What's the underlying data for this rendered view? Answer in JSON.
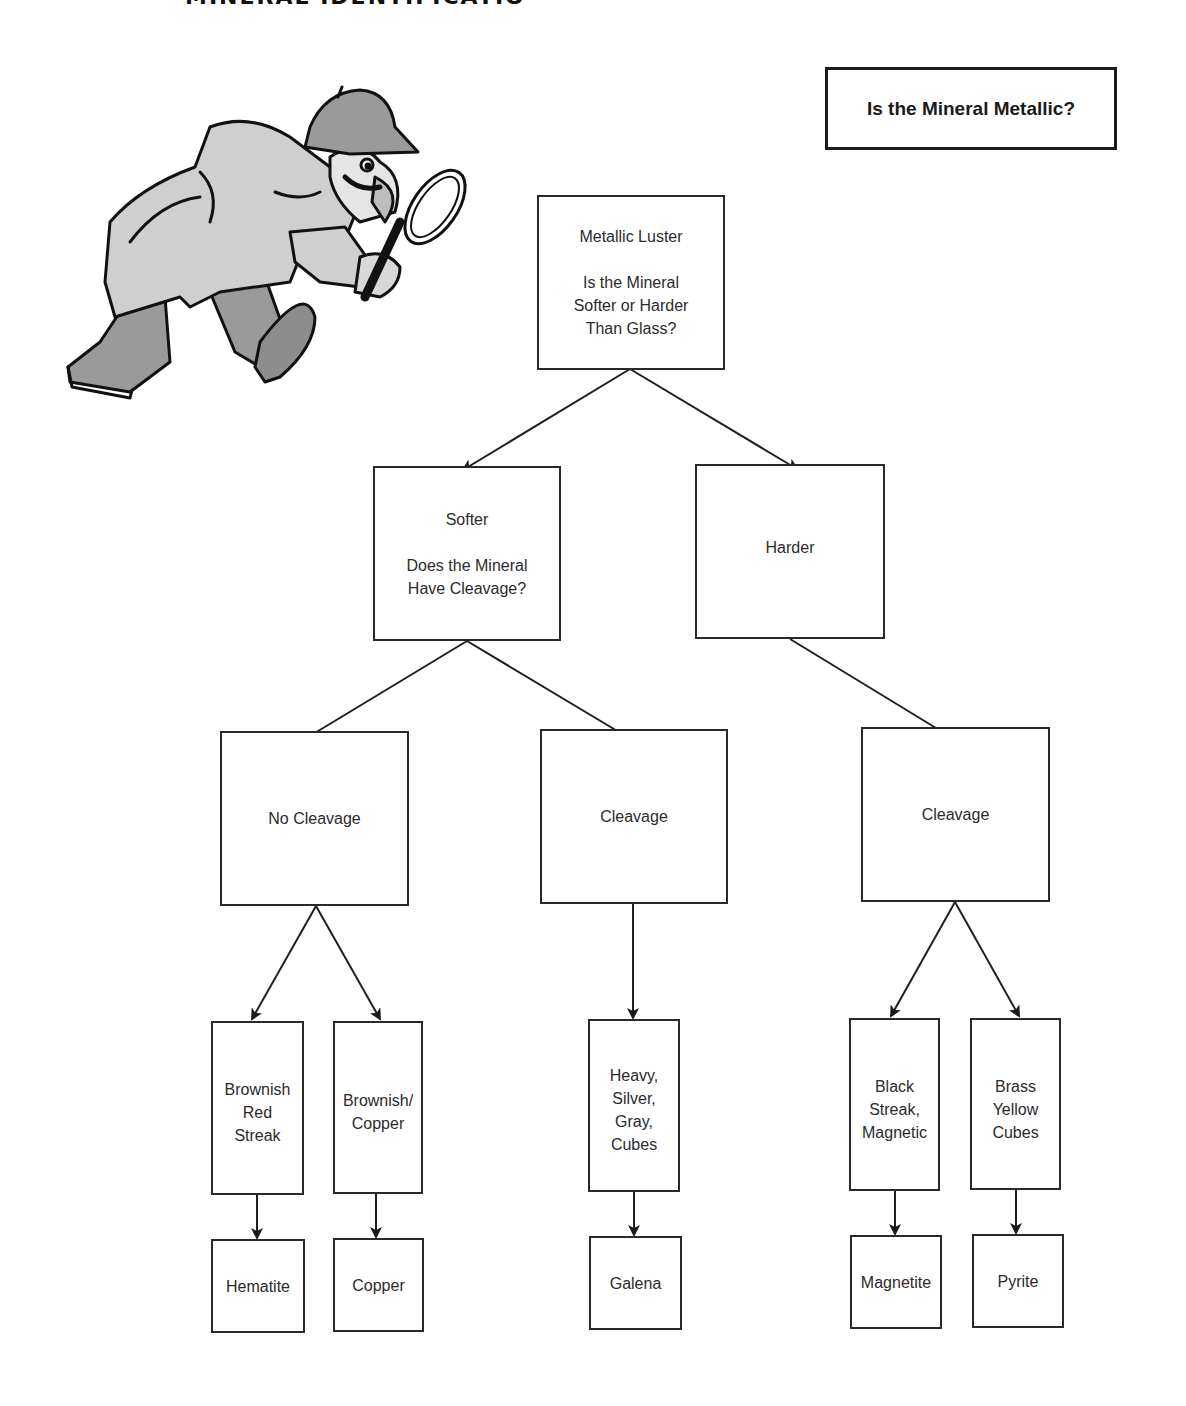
{
  "page": {
    "cutoff_title": "MINERAL IDENTIFICATION",
    "question_box": "Is the Mineral Metallic?"
  },
  "illustration": {
    "subject": "detective-with-magnifying-glass"
  },
  "flowchart": {
    "root": {
      "title": "Metallic Luster",
      "question_lines": [
        "Is the Mineral",
        "Softer or Harder",
        "Than Glass?"
      ]
    },
    "level2": {
      "softer": {
        "title": "Softer",
        "question_lines": [
          "Does the Mineral",
          "Have Cleavage?"
        ]
      },
      "harder": {
        "title": "Harder"
      }
    },
    "level3": {
      "no_cleavage": "No Cleavage",
      "soft_cleavage": "Cleavage",
      "hard_cleavage": "Cleavage"
    },
    "properties": [
      {
        "id": "brownish-red-streak",
        "lines": [
          "Brownish",
          "Red",
          "Streak"
        ]
      },
      {
        "id": "brownish-copper",
        "lines": [
          "Brownish/",
          "Copper"
        ]
      },
      {
        "id": "heavy-silver-gray-cubes",
        "lines": [
          "Heavy,",
          "Silver,",
          "Gray,",
          "Cubes"
        ]
      },
      {
        "id": "black-streak-magnetic",
        "lines": [
          "Black",
          "Streak,",
          "Magnetic"
        ]
      },
      {
        "id": "brass-yellow-cubes",
        "lines": [
          "Brass",
          "Yellow",
          "Cubes"
        ]
      }
    ],
    "minerals": [
      "Hematite",
      "Copper",
      "Galena",
      "Magnetite",
      "Pyrite"
    ]
  },
  "colors": {
    "line": "#222222",
    "background": "#ffffff",
    "text": "#2b2b2b"
  }
}
